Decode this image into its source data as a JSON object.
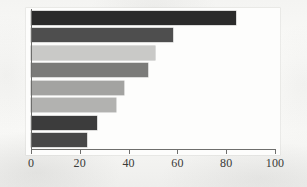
{
  "chart_data": {
    "type": "bar",
    "orientation": "horizontal",
    "title": "",
    "subtitle": "",
    "xlabel": "",
    "ylabel": "",
    "xlim": [
      0,
      100
    ],
    "grid": false,
    "legend": null,
    "categories": [
      "1",
      "2",
      "3",
      "4",
      "5",
      "6",
      "7",
      "8"
    ],
    "values": [
      84,
      58,
      51,
      48,
      38,
      35,
      27,
      23
    ],
    "bar_colors": [
      "#2b2b2b",
      "#4e4e4e",
      "#c9c9c7",
      "#7b7b79",
      "#a3a3a1",
      "#b2b2b0",
      "#3c3c3c",
      "#474747"
    ],
    "axis": {
      "x_ticks": [
        0,
        20,
        40,
        60,
        80,
        100
      ],
      "x_tick_labels": [
        "0",
        "20",
        "40",
        "60",
        "80",
        "100"
      ],
      "axis_color": "#6e6e6c"
    },
    "series": [
      {
        "name": "value",
        "values": [
          84,
          58,
          51,
          48,
          38,
          35,
          27,
          23
        ]
      }
    ]
  },
  "figure": {
    "background_color": "#f7f7f5",
    "plot_background_color": "#fdfdfc"
  }
}
